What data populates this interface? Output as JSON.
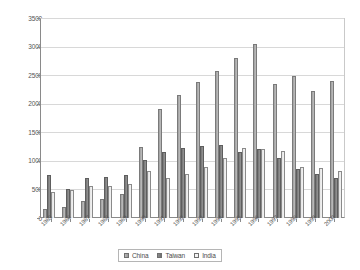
{
  "chart_data": {
    "type": "bar",
    "title": "",
    "subtitle": "",
    "xlabel": "",
    "ylabel": "",
    "ylim": [
      0,
      3500
    ],
    "ytick_step": 500,
    "yticks": [
      0,
      500,
      1000,
      1500,
      2000,
      2500,
      3000,
      3500
    ],
    "grid": true,
    "legend_position": "bottom",
    "categories": [
      "1985",
      "1986",
      "1987",
      "1988",
      "1989",
      "1990",
      "1991",
      "1992",
      "1993",
      "1994",
      "1995",
      "1996",
      "1997",
      "1998",
      "1999",
      "2000"
    ],
    "series": [
      {
        "name": "China",
        "color": "#9a9a9a",
        "values": [
          150,
          200,
          300,
          330,
          420,
          1250,
          1910,
          2160,
          2390,
          2590,
          2820,
          3060,
          2360,
          2490,
          2230,
          2410
        ]
      },
      {
        "name": "Taiwan",
        "color": "#6f6f6f",
        "values": [
          760,
          510,
          700,
          730,
          750,
          1020,
          1160,
          1240,
          1270,
          1290,
          1160,
          1220,
          1060,
          870,
          780,
          700
        ]
      },
      {
        "name": "India",
        "color": "#f4f4f4",
        "values": [
          460,
          490,
          560,
          570,
          590,
          820,
          700,
          780,
          900,
          1050,
          1230,
          1220,
          1180,
          890,
          880,
          820
        ]
      }
    ]
  },
  "legend": {
    "items": [
      {
        "label": "China",
        "key": "china"
      },
      {
        "label": "Taiwan",
        "key": "taiwan"
      },
      {
        "label": "India",
        "key": "india"
      }
    ]
  }
}
